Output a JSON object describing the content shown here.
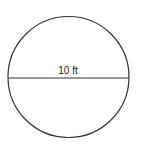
{
  "diagram": {
    "shape": "circle",
    "diameter_label": "10 ft",
    "stroke_color": "#333333",
    "background_color": "#ffffff"
  }
}
